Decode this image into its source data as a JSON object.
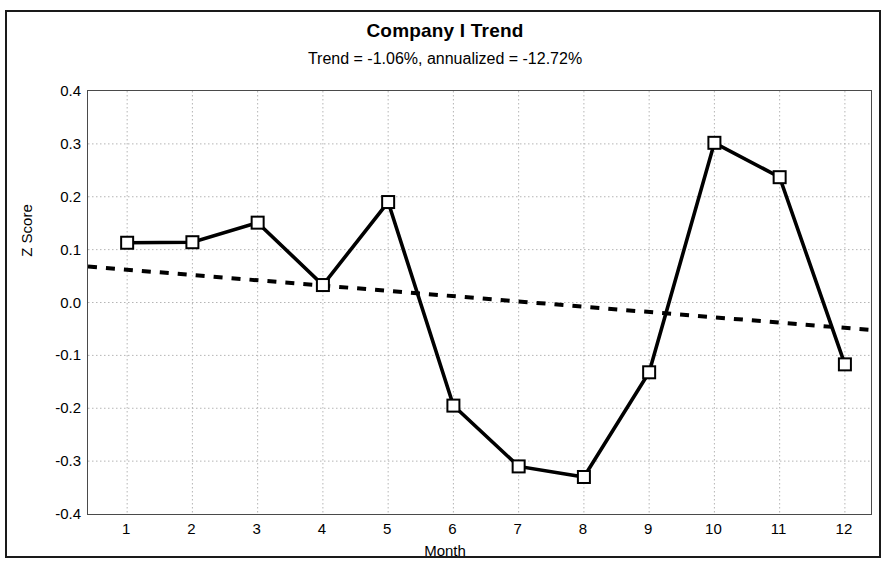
{
  "chart_data": {
    "type": "line",
    "title": "Company I Trend",
    "subtitle": "Trend = -1.06%,  annualized = -12.72%",
    "xlabel": "Month",
    "ylabel": "Z Score",
    "categories": [
      1,
      2,
      3,
      4,
      5,
      6,
      7,
      8,
      9,
      10,
      11,
      12
    ],
    "x_tick_labels": [
      "1",
      "2",
      "3",
      "4",
      "5",
      "6",
      "7",
      "8",
      "9",
      "10",
      "11",
      "12"
    ],
    "y_tick_labels": [
      "0.4",
      "0.3",
      "0.2",
      "0.1",
      "0.0",
      "-0.1",
      "-0.2",
      "-0.3",
      "-0.4"
    ],
    "y_ticks": [
      0.4,
      0.3,
      0.2,
      0.1,
      0.0,
      -0.1,
      -0.2,
      -0.3,
      -0.4
    ],
    "ylim": [
      -0.4,
      0.4
    ],
    "xlim": [
      0.4,
      12.4
    ],
    "grid": true,
    "legend": "none",
    "series": [
      {
        "name": "Z Score",
        "style": "solid-line-square-markers",
        "color": "#000000",
        "marker": "open-square",
        "values": [
          0.113,
          0.114,
          0.151,
          0.033,
          0.19,
          -0.195,
          -0.31,
          -0.33,
          -0.132,
          0.302,
          0.237,
          -0.117
        ]
      },
      {
        "name": "Trend line",
        "style": "dotted-line",
        "color": "#000000",
        "marker": "none",
        "endpoints": {
          "x_start": 0.4,
          "y_start": 0.068,
          "x_end": 12.4,
          "y_end": -0.052
        }
      }
    ]
  },
  "colors": {
    "frame": "#1a1a1a",
    "axis": "#4a4a4a",
    "grid": "#b5b5b5",
    "data_line": "#000000",
    "marker_fill": "#ffffff",
    "background": "#ffffff"
  }
}
